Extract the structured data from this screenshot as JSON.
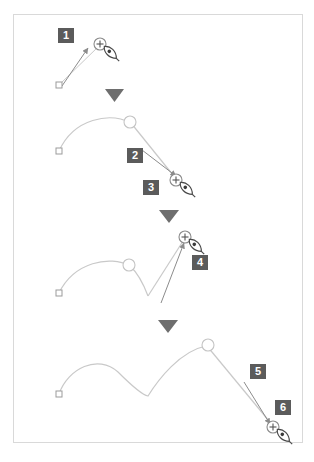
{
  "diagram": {
    "type": "instructional-sequence",
    "frame": {
      "border_color": "#d9d9d9",
      "background": "#ffffff"
    },
    "colors": {
      "badge_background": "#5b5b5b",
      "badge_text": "#ffffff",
      "path_stroke": "#bdbdbd",
      "anchor_stroke": "#b0b0b0",
      "arrow_stroke": "#8c8c8c",
      "cursor_stroke": "#4a4a4a",
      "separator_fill": "#6e6e6e"
    },
    "badges": [
      {
        "label": "1",
        "x": 58,
        "y": 28
      },
      {
        "label": "2",
        "x": 127,
        "y": 148
      },
      {
        "label": "3",
        "x": 143,
        "y": 180
      },
      {
        "label": "4",
        "x": 192,
        "y": 255
      },
      {
        "label": "5",
        "x": 250,
        "y": 364
      },
      {
        "label": "6",
        "x": 275,
        "y": 400
      }
    ],
    "separators": [
      {
        "name": "step-separator-1",
        "cx": 114,
        "cy": 95
      },
      {
        "name": "step-separator-2",
        "cx": 169,
        "cy": 216
      },
      {
        "name": "step-separator-3",
        "cx": 168,
        "cy": 327
      }
    ],
    "panels": [
      {
        "name": "panel-1",
        "description": "First click creates an anchor, dragging up-right pulls out a direction handle",
        "anchors": [
          {
            "type": "square",
            "x": 59,
            "y": 85
          }
        ],
        "new_point": {
          "type": "plus-circle",
          "x": 100,
          "y": 44
        },
        "cursor": {
          "type": "pen-nib",
          "x": 110,
          "y": 52
        },
        "drag_line": {
          "x1": 60,
          "y1": 84,
          "x2": 100,
          "y2": 45
        },
        "arrow": {
          "x1": 62,
          "y1": 86,
          "x2": 88,
          "y2": 48
        }
      },
      {
        "name": "panel-2",
        "description": "Second click creates a curve; dragging down-right sets the next handle",
        "anchors": [
          {
            "type": "square",
            "x": 59,
            "y": 151
          },
          {
            "type": "circle",
            "x": 130,
            "y": 122
          }
        ],
        "curve": "M59,151 C74,118 110,112 131,123",
        "tangent_line": {
          "x1": 131,
          "y1": 123,
          "x2": 177,
          "y2": 180
        },
        "new_point": {
          "type": "plus-circle",
          "x": 176,
          "y": 180
        },
        "cursor": {
          "type": "pen-nib",
          "x": 186,
          "y": 188
        },
        "arrow": {
          "x1": 142,
          "y1": 150,
          "x2": 176,
          "y2": 176
        }
      },
      {
        "name": "panel-3",
        "description": "Third click adds a corner; dragging up-right builds the rising segment",
        "anchors": [
          {
            "type": "square",
            "x": 59,
            "y": 293
          },
          {
            "type": "circle",
            "x": 129,
            "y": 265
          }
        ],
        "curve": "M59,293 C74,262 110,255 130,266 C140,275 145,288 148,295",
        "tangent_line": {
          "x1": 148,
          "y1": 295,
          "x2": 185,
          "y2": 237
        },
        "new_point": {
          "type": "plus-circle",
          "x": 185,
          "y": 237
        },
        "cursor": {
          "type": "pen-nib",
          "x": 195,
          "y": 245
        },
        "arrow": {
          "x1": 161,
          "y1": 303,
          "x2": 184,
          "y2": 243
        }
      },
      {
        "name": "panel-4",
        "description": "Path smoothed into two humps; dragging down-right extends past the last anchor",
        "anchors": [
          {
            "type": "square",
            "x": 59,
            "y": 394
          },
          {
            "type": "circle",
            "x": 208,
            "y": 345
          }
        ],
        "curve": "M59,394 C70,366 100,354 118,372 C132,386 142,395 148,396 C158,381 180,352 206,346",
        "tangent_line": {
          "x1": 207,
          "y1": 346,
          "x2": 274,
          "y2": 427
        },
        "new_point": {
          "type": "plus-circle",
          "x": 273,
          "y": 427
        },
        "cursor": {
          "type": "pen-nib",
          "x": 283,
          "y": 435
        },
        "arrow": {
          "x1": 244,
          "y1": 382,
          "x2": 270,
          "y2": 424
        }
      }
    ]
  }
}
